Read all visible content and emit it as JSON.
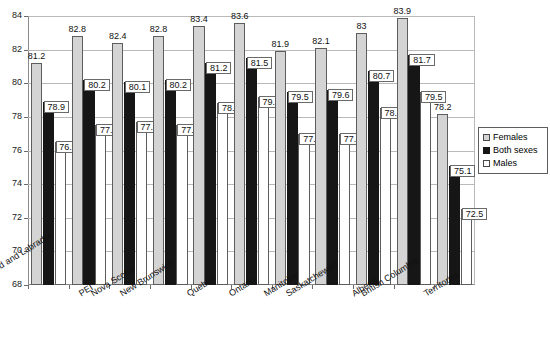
{
  "chart_data": {
    "type": "bar",
    "title": "",
    "subtitle": "",
    "xlabel": "",
    "ylabel": "",
    "ylim": [
      68,
      84
    ],
    "yticks": [
      68,
      70,
      72,
      74,
      76,
      78,
      80,
      82,
      84
    ],
    "grid": true,
    "legend_position": "right",
    "categories": [
      "Newfoundland and Labrador",
      "PEI",
      "Nova Scotia",
      "New Brunswick",
      "Quebec",
      "Ontario",
      "Manitoba",
      "Saskatchewan",
      "Alberta",
      "British Columbia",
      "Territories"
    ],
    "series": [
      {
        "name": "Females",
        "color": "#d4d4d4",
        "values": [
          81.2,
          82.8,
          82.4,
          82.8,
          83.4,
          83.6,
          81.9,
          82.1,
          83,
          83.9,
          78.2
        ],
        "labels": [
          "81.2",
          "82.8",
          "82.4",
          "82.8",
          "83.4",
          "83.6",
          "81.9",
          "82.1",
          "83",
          "83.9",
          "78.2"
        ]
      },
      {
        "name": "Both sexes",
        "color": "#161616",
        "values": [
          78.9,
          80.2,
          80.1,
          80.2,
          81.2,
          81.5,
          79.5,
          79.6,
          80.7,
          81.7,
          75.1
        ],
        "labels": [
          "78.9",
          "80.2",
          "80.1",
          "80.2",
          "81.2",
          "81.5",
          "79.5",
          "79.6",
          "80.7",
          "81.7",
          "75.1"
        ]
      },
      {
        "name": "Males",
        "color": "#ffffff",
        "values": [
          76.5,
          77.5,
          77.7,
          77.5,
          78.8,
          79.2,
          77.0,
          77.0,
          78.5,
          79.5,
          72.5
        ],
        "labels": [
          "76.5",
          "77.5",
          "77.7",
          "77.5",
          "78.8",
          "79.2",
          "77.0",
          "77.0",
          "78.5",
          "79.5",
          "72.5"
        ]
      }
    ]
  },
  "legend": {
    "items": [
      {
        "label": "Females",
        "key": "females"
      },
      {
        "label": "Both sexes",
        "key": "both"
      },
      {
        "label": "Males",
        "key": "males"
      }
    ]
  }
}
